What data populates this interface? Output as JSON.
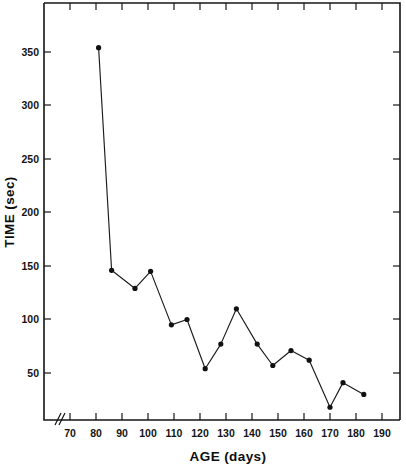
{
  "chart_data": {
    "type": "line",
    "title": "",
    "xlabel": "AGE (days)",
    "ylabel": "TIME (sec)",
    "xlim": [
      63,
      196
    ],
    "ylim": [
      0,
      390
    ],
    "xticks": [
      70,
      80,
      90,
      100,
      110,
      120,
      130,
      140,
      150,
      160,
      170,
      180,
      190
    ],
    "xticklabels": [
      "70",
      "80",
      "90",
      "100",
      "110",
      "120",
      "130",
      "140",
      "150",
      "160",
      "170",
      "180",
      "190"
    ],
    "yticks": [
      50,
      100,
      150,
      200,
      250,
      300,
      350
    ],
    "yticklabels": [
      "50",
      "100",
      "150",
      "200",
      "250",
      "300",
      "350"
    ],
    "grid": false,
    "legend": false,
    "axis_break": "x-axis break between origin and first tick",
    "marker": "filled-circle",
    "x": [
      81,
      86,
      95,
      101,
      109,
      115,
      122,
      128,
      134,
      142,
      148,
      155,
      162,
      170,
      175,
      183
    ],
    "values": [
      354,
      146,
      129,
      145,
      95,
      100,
      54,
      77,
      110,
      77,
      57,
      71,
      62,
      18,
      41,
      30
    ],
    "points": [
      {
        "age": 81,
        "time": 354
      },
      {
        "age": 86,
        "time": 146
      },
      {
        "age": 95,
        "time": 129
      },
      {
        "age": 101,
        "time": 145
      },
      {
        "age": 109,
        "time": 95
      },
      {
        "age": 115,
        "time": 100
      },
      {
        "age": 122,
        "time": 54
      },
      {
        "age": 128,
        "time": 77
      },
      {
        "age": 134,
        "time": 110
      },
      {
        "age": 142,
        "time": 77
      },
      {
        "age": 148,
        "time": 57
      },
      {
        "age": 155,
        "time": 71
      },
      {
        "age": 162,
        "time": 62
      },
      {
        "age": 170,
        "time": 18
      },
      {
        "age": 175,
        "time": 41
      },
      {
        "age": 183,
        "time": 30
      }
    ],
    "colors": {
      "line": "#1b1b1b",
      "marker": "#111111",
      "axis": "#161616",
      "background": "#ffffff"
    }
  }
}
